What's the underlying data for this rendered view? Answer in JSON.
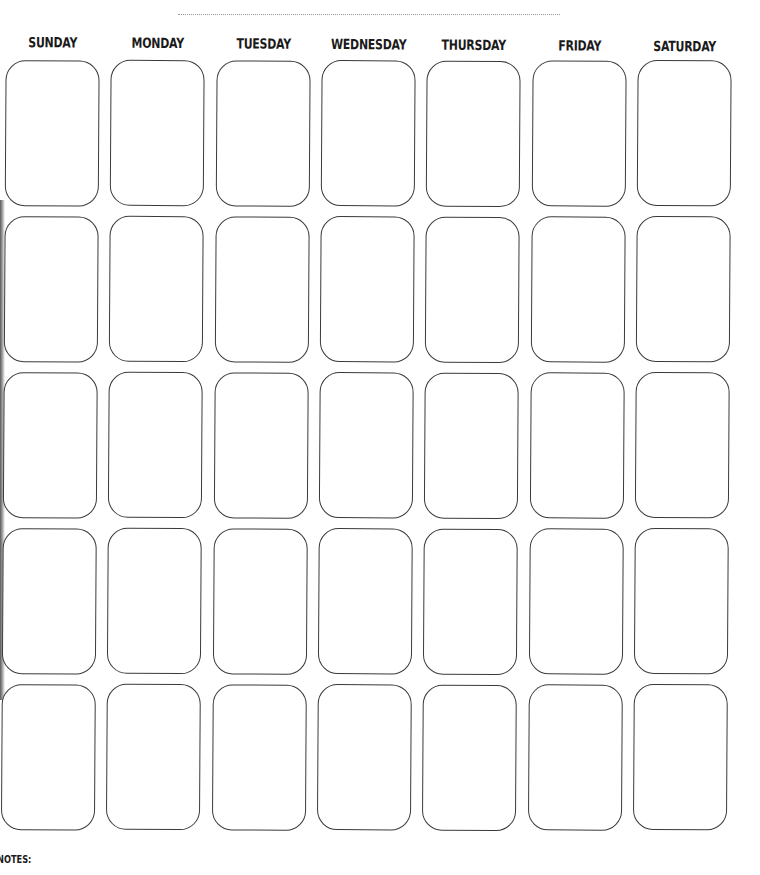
{
  "page": {
    "title_line": "",
    "days": [
      "SUNDAY",
      "MONDAY",
      "TUESDAY",
      "WEDNESDAY",
      "THURSDAY",
      "FRIDAY",
      "SATURDAY"
    ],
    "weeks": 5,
    "notes_label": "NOTES:",
    "colors": {
      "background": "#ffffff",
      "outline": "#3a3a3a",
      "text": "#1a1a1a",
      "dotted_line": "#9a9a9a"
    }
  }
}
